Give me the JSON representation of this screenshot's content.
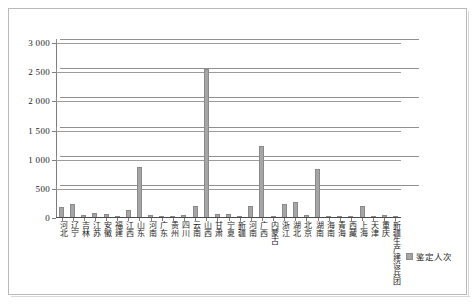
{
  "chart_data": {
    "type": "bar",
    "title": "",
    "subtitle": "",
    "xlabel": "",
    "ylabel": "",
    "ylim": [
      0,
      3000
    ],
    "ytick_labels": [
      "0",
      "500",
      "1 000",
      "1 500",
      "2 000",
      "2 500",
      "3 000"
    ],
    "ytick_values": [
      0,
      500,
      1000,
      1500,
      2000,
      2500,
      3000
    ],
    "grid": true,
    "legend_position": "bottom-right",
    "legend_entries": [
      "鉴定人次"
    ],
    "series": [
      {
        "name": "鉴定人次",
        "color": "#a6a6a6",
        "values": [
          175,
          215,
          30,
          60,
          50,
          20,
          120,
          865,
          30,
          25,
          20,
          30,
          180,
          2540,
          45,
          55,
          20,
          180,
          1215,
          10,
          230,
          255,
          35,
          820,
          15,
          25,
          20,
          195,
          20,
          30,
          10
        ]
      }
    ],
    "categories": [
      "河北",
      "辽宁",
      "吉林",
      "江苏",
      "安徽",
      "福建",
      "江西",
      "山东",
      "河南",
      "广东",
      "贵州",
      "四川",
      "云南",
      "山西",
      "甘肃",
      "宁夏",
      "新疆",
      "河南",
      "广西",
      "内蒙古",
      "浙江",
      "湖北",
      "北京",
      "湖南",
      "海南",
      "青海",
      "西藏",
      "上海",
      "天津",
      "重庆",
      "新疆生产建设兵团"
    ]
  },
  "legend": {
    "label": "鉴定人次",
    "swatch_color": "#a6a6a6"
  },
  "axis": {
    "y_labels": [
      "3 000",
      "2 500",
      "2 000",
      "1 500",
      "1 000",
      "500",
      "0"
    ]
  }
}
